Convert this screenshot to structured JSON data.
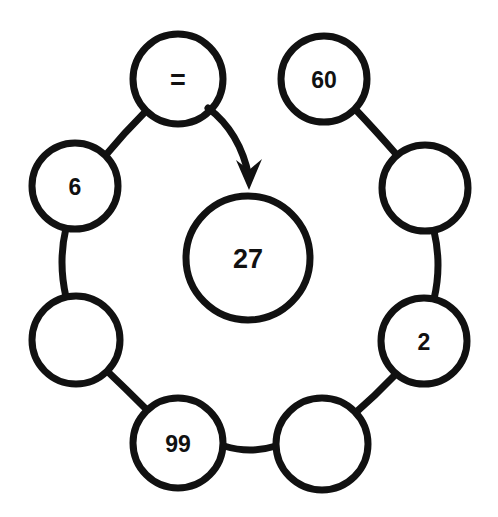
{
  "canvas": {
    "width": 498,
    "height": 517,
    "background": "#ffffff"
  },
  "style": {
    "stroke_color": "#111111",
    "node_stroke_width": 7,
    "link_stroke_width": 7,
    "fill_color": "#ffffff",
    "text_color": "#111111"
  },
  "diagram": {
    "type": "ring-with-center",
    "center_node": {
      "id": "center",
      "label": "27",
      "cx": 248,
      "cy": 258,
      "r": 62
    },
    "ring_nodes": [
      {
        "id": "n1",
        "label": "=",
        "cx": 178,
        "cy": 79,
        "r": 45
      },
      {
        "id": "n2",
        "label": "60",
        "cx": 324,
        "cy": 79,
        "r": 43
      },
      {
        "id": "n3",
        "label": "",
        "cx": 425,
        "cy": 188,
        "r": 43
      },
      {
        "id": "n4",
        "label": "2",
        "cx": 424,
        "cy": 341,
        "r": 43
      },
      {
        "id": "n5",
        "label": "",
        "cx": 322,
        "cy": 444,
        "r": 46
      },
      {
        "id": "n6",
        "label": "99",
        "cx": 178,
        "cy": 443,
        "r": 45
      },
      {
        "id": "n7",
        "label": "",
        "cx": 76,
        "cy": 340,
        "r": 44
      },
      {
        "id": "n8",
        "label": "6",
        "cx": 75,
        "cy": 186,
        "r": 43
      }
    ],
    "links": [
      {
        "from": "n2",
        "to": "n3",
        "path": "M 356 110 Q 375 130 396 154"
      },
      {
        "from": "n3",
        "to": "n4",
        "path": "M 434 231 Q 442 265 434 299"
      },
      {
        "from": "n4",
        "to": "n5",
        "path": "M 395 375 Q 375 396 353 415"
      },
      {
        "from": "n5",
        "to": "n6",
        "path": "M 276 446 Q 250 454 224 446"
      },
      {
        "from": "n6",
        "to": "n7",
        "path": "M 146 409 Q 126 389 105 369"
      },
      {
        "from": "n7",
        "to": "n8",
        "path": "M 66 297 Q 58 262 66 228"
      },
      {
        "from": "n8",
        "to": "n1",
        "path": "M 105 156 Q 124 133 146 111"
      }
    ],
    "arrow": {
      "from": "n1",
      "to": "center",
      "path": "M 208 108 Q 240 132 249 177",
      "head_points": "249,190 236,160 249,170 262,159",
      "tip_x": 249,
      "tip_y": 190
    }
  }
}
